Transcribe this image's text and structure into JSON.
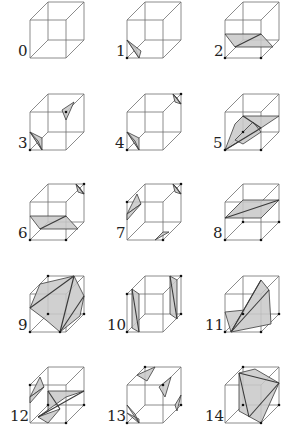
{
  "figure": {
    "title": "",
    "cases": [
      {
        "label": "0"
      },
      {
        "label": "1"
      },
      {
        "label": "2"
      },
      {
        "label": "3"
      },
      {
        "label": "4"
      },
      {
        "label": "5"
      },
      {
        "label": "6"
      },
      {
        "label": "7"
      },
      {
        "label": "8"
      },
      {
        "label": "9"
      },
      {
        "label": "10"
      },
      {
        "label": "11"
      },
      {
        "label": "12"
      },
      {
        "label": "13"
      },
      {
        "label": "14"
      }
    ]
  },
  "colors": {
    "edge": "#6e6e6e",
    "surface_fill": "#c8c8c8",
    "surface_stroke": "#3a3a3a",
    "vertex": "#111111"
  }
}
